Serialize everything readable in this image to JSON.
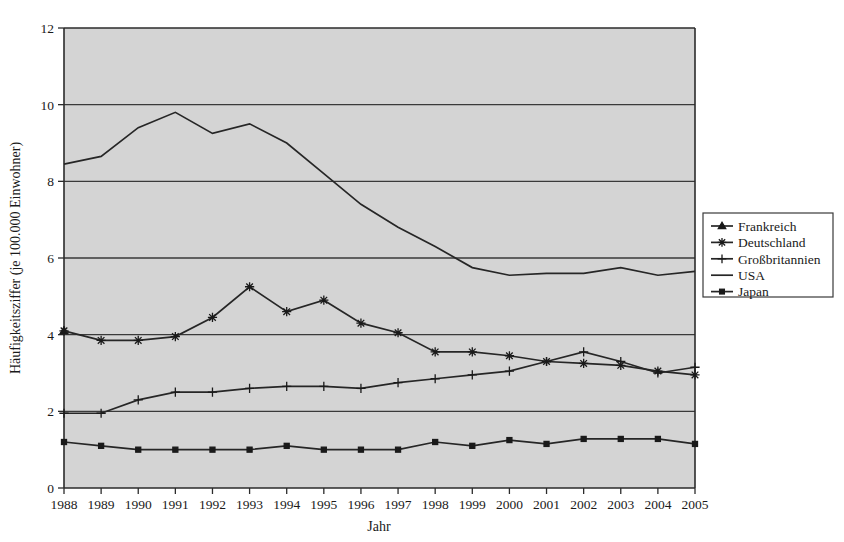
{
  "chart_data": {
    "type": "line",
    "title": "",
    "xlabel": "Jahr",
    "ylabel": "Häufigkeitsziffer (je 100.000 Einwohner)",
    "categories": [
      "1988",
      "1989",
      "1990",
      "1991",
      "1992",
      "1993",
      "1994",
      "1995",
      "1996",
      "1997",
      "1998",
      "1999",
      "2000",
      "2001",
      "2002",
      "2003",
      "2004",
      "2005"
    ],
    "x": [
      1988,
      1989,
      1990,
      1991,
      1992,
      1993,
      1994,
      1995,
      1996,
      1997,
      1998,
      1999,
      2000,
      2001,
      2002,
      2003,
      2004,
      2005
    ],
    "ylim": [
      0,
      12
    ],
    "xlim": [
      1988,
      2005
    ],
    "yticks": [
      0,
      2,
      4,
      6,
      8,
      10,
      12
    ],
    "ytick_labels": [
      "0",
      "2",
      "4",
      "6",
      "8",
      "10",
      "12"
    ],
    "grid": true,
    "grid_axis": "y",
    "legend_position": "right",
    "plot_background": "#d4d4d4",
    "line_color": "#262626",
    "series": [
      {
        "name": "Frankreich",
        "marker": "triangle",
        "values": [
          4.1,
          null,
          null,
          null,
          null,
          null,
          null,
          null,
          null,
          null,
          null,
          null,
          null,
          null,
          null,
          null,
          null,
          null
        ]
      },
      {
        "name": "Deutschland",
        "marker": "star",
        "values": [
          4.1,
          3.85,
          3.85,
          3.95,
          4.45,
          5.25,
          4.6,
          4.9,
          4.3,
          4.05,
          3.55,
          3.55,
          3.45,
          3.3,
          3.25,
          3.2,
          3.05,
          2.95
        ]
      },
      {
        "name": "Großbritannien",
        "marker": "plus",
        "values": [
          1.95,
          1.95,
          2.3,
          2.5,
          2.5,
          2.6,
          2.65,
          2.65,
          2.6,
          2.75,
          2.85,
          2.95,
          3.05,
          3.3,
          3.55,
          3.3,
          3.0,
          3.15
        ]
      },
      {
        "name": "USA",
        "marker": "none",
        "values": [
          8.45,
          8.65,
          9.4,
          9.8,
          9.25,
          9.5,
          9.0,
          8.2,
          7.4,
          6.8,
          6.3,
          5.75,
          5.55,
          5.6,
          5.6,
          5.75,
          5.55,
          5.65
        ]
      },
      {
        "name": "Japan",
        "marker": "square",
        "values": [
          1.2,
          1.1,
          1.0,
          1.0,
          1.0,
          1.0,
          1.1,
          1.0,
          1.0,
          1.0,
          1.2,
          1.1,
          1.25,
          1.15,
          1.28,
          1.28,
          1.28,
          1.15
        ]
      }
    ]
  },
  "legend": {
    "entries": [
      {
        "label": "Frankreich"
      },
      {
        "label": "Deutschland"
      },
      {
        "label": "Großbritannien"
      },
      {
        "label": "USA"
      },
      {
        "label": "Japan"
      }
    ]
  }
}
